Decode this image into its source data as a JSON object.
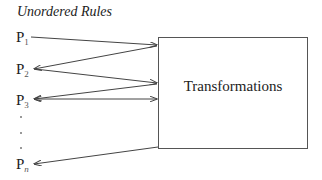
{
  "title": "Unordered Rules",
  "rules": [
    {
      "base": "P",
      "sub": "1"
    },
    {
      "base": "P",
      "sub": "2"
    },
    {
      "base": "P",
      "sub": "3"
    },
    {
      "base": "P",
      "sub": "n"
    }
  ],
  "ellipsis": [
    ".",
    ".",
    "."
  ],
  "box": {
    "label": "Transformations"
  },
  "colors": {
    "line": "#444444",
    "text": "#222222"
  }
}
